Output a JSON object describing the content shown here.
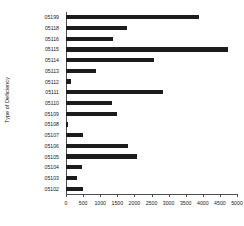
{
  "chart_data": {
    "type": "bar",
    "orientation": "horizontal",
    "title": "",
    "xlabel": "",
    "ylabel": "Type of Deficiency",
    "xlim": [
      0,
      5000
    ],
    "grid": false,
    "legend": null,
    "bar_color": "#1c1c1c",
    "xticks": [
      0,
      500,
      1000,
      1500,
      2000,
      2500,
      3000,
      3500,
      4000,
      4500,
      5000
    ],
    "xtick_labels": [
      "0",
      "500",
      "1000",
      "1500",
      "2000",
      "2500",
      "3000",
      "3500",
      "4000",
      "4500",
      "5000"
    ],
    "categories": [
      "05199",
      "05118",
      "05116",
      "05115",
      "05114",
      "05113",
      "05112",
      "05111",
      "05110",
      "05109",
      "05108",
      "05107",
      "05106",
      "05105",
      "05104",
      "05103",
      "05102"
    ],
    "values": [
      3900,
      1780,
      1370,
      4740,
      2570,
      880,
      150,
      2830,
      1340,
      1490,
      70,
      500,
      1810,
      2070,
      470,
      330,
      500
    ]
  }
}
